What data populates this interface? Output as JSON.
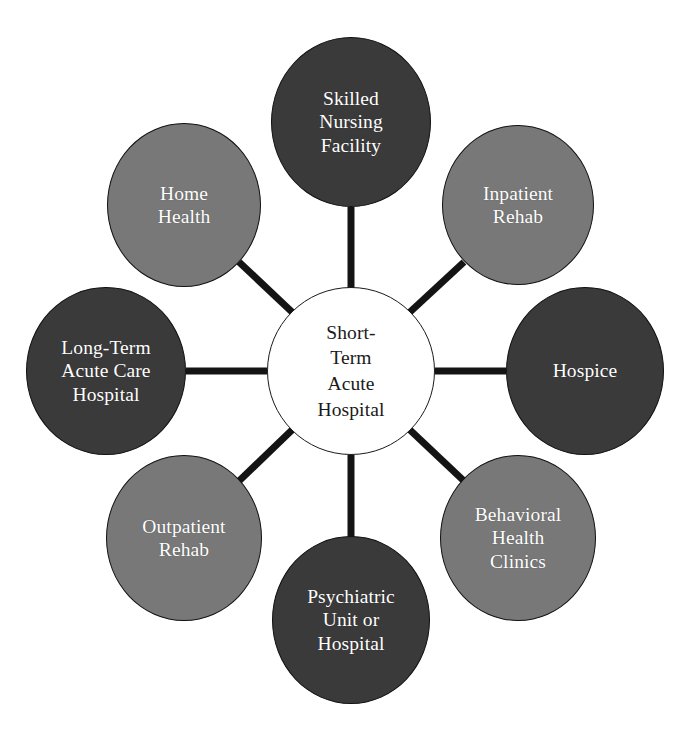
{
  "diagram": {
    "type": "hub-and-spoke",
    "background_color": "#ffffff",
    "spoke_color": "#141414",
    "spoke_width": 7,
    "center": {
      "id": "short-term-acute-hospital",
      "label": "Short-\nTerm\nAcute\nHospital",
      "fill": "#ffffff",
      "text_color": "#1a1a1a",
      "border_color": "#1a1a1a",
      "cx": 351,
      "cy": 371,
      "rx": 84,
      "ry": 84
    },
    "satellites": [
      {
        "id": "skilled-nursing-facility",
        "label": "Skilled\nNursing\nFacility",
        "fill": "#3a3a3a",
        "text_color": "#ffffff",
        "angle_deg": 90,
        "cx": 351,
        "cy": 122,
        "rx": 80,
        "ry": 85
      },
      {
        "id": "inpatient-rehab",
        "label": "Inpatient\nRehab",
        "fill": "#787878",
        "text_color": "#ffffff",
        "angle_deg": 45,
        "cx": 518,
        "cy": 205,
        "rx": 76,
        "ry": 80
      },
      {
        "id": "hospice",
        "label": "Hospice",
        "fill": "#3a3a3a",
        "text_color": "#ffffff",
        "angle_deg": 0,
        "cx": 585,
        "cy": 371,
        "rx": 79,
        "ry": 84
      },
      {
        "id": "behavioral-health-clinics",
        "label": "Behavioral\nHealth\nClinics",
        "fill": "#787878",
        "text_color": "#ffffff",
        "angle_deg": -45,
        "cx": 518,
        "cy": 538,
        "rx": 78,
        "ry": 83
      },
      {
        "id": "psychiatric-unit-or-hospital",
        "label": "Psychiatric\nUnit or\nHospital",
        "fill": "#3a3a3a",
        "text_color": "#ffffff",
        "angle_deg": -90,
        "cx": 351,
        "cy": 620,
        "rx": 79,
        "ry": 84
      },
      {
        "id": "outpatient-rehab",
        "label": "Outpatient\nRehab",
        "fill": "#787878",
        "text_color": "#ffffff",
        "angle_deg": -135,
        "cx": 184,
        "cy": 538,
        "rx": 78,
        "ry": 83
      },
      {
        "id": "long-term-acute-care-hospital",
        "label": "Long-Term\nAcute Care\nHospital",
        "fill": "#3a3a3a",
        "text_color": "#ffffff",
        "angle_deg": 180,
        "cx": 106,
        "cy": 371,
        "rx": 80,
        "ry": 84
      },
      {
        "id": "home-health",
        "label": "Home\nHealth",
        "fill": "#787878",
        "text_color": "#ffffff",
        "angle_deg": 135,
        "cx": 184,
        "cy": 205,
        "rx": 77,
        "ry": 82
      }
    ],
    "connectors": [
      {
        "id": "spoke-skilled-nursing-facility",
        "from": "short-term-acute-hospital",
        "to": "skilled-nursing-facility",
        "x1": 351,
        "y1": 288,
        "x2": 351,
        "y2": 207
      },
      {
        "id": "spoke-inpatient-rehab",
        "from": "short-term-acute-hospital",
        "to": "inpatient-rehab",
        "x1": 410,
        "y1": 312,
        "x2": 464,
        "y2": 262
      },
      {
        "id": "spoke-hospice",
        "from": "short-term-acute-hospital",
        "to": "hospice",
        "x1": 435,
        "y1": 371,
        "x2": 506,
        "y2": 371
      },
      {
        "id": "spoke-behavioral-health-clinics",
        "from": "short-term-acute-hospital",
        "to": "behavioral-health-clinics",
        "x1": 410,
        "y1": 430,
        "x2": 464,
        "y2": 481
      },
      {
        "id": "spoke-psychiatric-unit-or-hospital",
        "from": "short-term-acute-hospital",
        "to": "psychiatric-unit-or-hospital",
        "x1": 351,
        "y1": 455,
        "x2": 351,
        "y2": 537
      },
      {
        "id": "spoke-outpatient-rehab",
        "from": "short-term-acute-hospital",
        "to": "outpatient-rehab",
        "x1": 292,
        "y1": 430,
        "x2": 239,
        "y2": 481
      },
      {
        "id": "spoke-long-term-acute-care-hospital",
        "from": "short-term-acute-hospital",
        "to": "long-term-acute-care-hospital",
        "x1": 267,
        "y1": 371,
        "x2": 186,
        "y2": 371
      },
      {
        "id": "spoke-home-health",
        "from": "short-term-acute-hospital",
        "to": "home-health",
        "x1": 292,
        "y1": 312,
        "x2": 239,
        "y2": 262
      }
    ]
  }
}
